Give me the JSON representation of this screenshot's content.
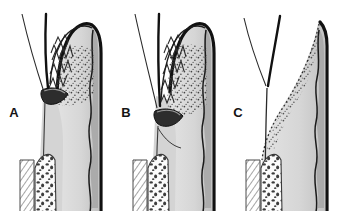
{
  "figure": {
    "name": "periodontal-pocket-progression-diagram",
    "background_color": "#ffffff",
    "width": 341,
    "height": 219,
    "panel_count": 3
  },
  "palette": {
    "background": "#ffffff",
    "outline_black": "#111111",
    "enamel_gray": "#d7d7d7",
    "dentin_gray": "#cfcfcf",
    "gingiva_gray": "#d2d2d2",
    "band_gray": "#9a9a9a",
    "calculus_dark": "#2d2d2d",
    "stipple_dot": "#3a3a3a",
    "hatch_line": "#5a5a5a",
    "label_text": "#141414"
  },
  "panels": [
    {
      "id": "panel-a",
      "label": "A",
      "label_x": 14,
      "label_y": 117,
      "origin_x": 0,
      "calculus_present": true,
      "calculus_y": 96,
      "enamel_zigzag": true,
      "stipple": true,
      "bone_hatching": true
    },
    {
      "id": "panel-b",
      "label": "B",
      "label_x": 126,
      "label_y": 117,
      "origin_x": 113,
      "calculus_present": true,
      "calculus_y": 117,
      "enamel_zigzag": true,
      "stipple": true,
      "bone_hatching": true
    },
    {
      "id": "panel-c",
      "label": "C",
      "label_x": 238,
      "label_y": 117,
      "origin_x": 226,
      "calculus_present": false,
      "calculus_y": 0,
      "enamel_zigzag": false,
      "stipple": true,
      "bone_hatching": true
    }
  ],
  "structures": {
    "probe_line_outer": "thin curved gingival margin line",
    "probe_line_inner": "thick dark curved sulcus line",
    "crown": "rounded tooth crown with thick black outer outline",
    "enamel_rods": "zigzag scalloped enamel rod pattern",
    "stippled_zone": "dotted stippling indicating inflamed connective tissue",
    "calculus": "dark crescent shaped calculus deposit",
    "dej_line": "wavy dentino-enamel junction line",
    "cortical_bone": "diagonal line hatching",
    "trabecular_bone": "mottled speckled alveolar crest"
  }
}
